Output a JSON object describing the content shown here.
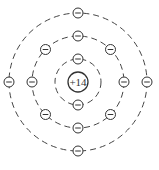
{
  "diagram": {
    "nucleus": {
      "label": "+14",
      "charge": 14
    },
    "center": [
      78,
      82
    ],
    "shells": [
      {
        "name": "shell-1",
        "radius": 23,
        "electron_count": 2,
        "angles": [
          270,
          90
        ]
      },
      {
        "name": "shell-2",
        "radius": 46,
        "electron_count": 8,
        "angles": [
          270,
          225,
          180,
          135,
          90,
          45,
          0,
          315
        ]
      },
      {
        "name": "shell-3",
        "radius": 69,
        "electron_count": 4,
        "angles": [
          270,
          180,
          90,
          0
        ]
      }
    ],
    "electron_symbol": "−"
  }
}
